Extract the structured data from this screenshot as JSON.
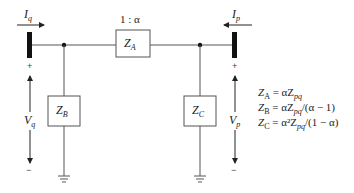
{
  "diagram": {
    "type": "circuit",
    "currents": {
      "left": {
        "symbol": "I",
        "sub": "q"
      },
      "right": {
        "symbol": "I",
        "sub": "p"
      }
    },
    "voltages": {
      "left": {
        "symbol": "V",
        "sub": "q",
        "plus": "+",
        "minus": "−"
      },
      "right": {
        "symbol": "V",
        "sub": "p",
        "plus": "+",
        "minus": "−"
      }
    },
    "ratio_label": "1 : α",
    "impedances": {
      "series": {
        "symbol": "Z",
        "sub": "A"
      },
      "shunt_left": {
        "symbol": "Z",
        "sub": "B"
      },
      "shunt_right": {
        "symbol": "Z",
        "sub": "C"
      }
    },
    "equations": [
      "Z_A = αZ_pq",
      "Z_B = αZ_pq/(α − 1)",
      "Z_C = α²Z_pq/(1 − α)"
    ],
    "equations_display": {
      "eq1": {
        "lhs": "Z",
        "lhs_sub": "A",
        "rhs_pre": " = αZ",
        "rhs_sub": "pq",
        "rhs_post": ""
      },
      "eq2": {
        "lhs": "Z",
        "lhs_sub": "B",
        "rhs_pre": " = αZ",
        "rhs_sub": "pq",
        "rhs_post": "/(α − 1)"
      },
      "eq3": {
        "lhs": "Z",
        "lhs_sub": "C",
        "rhs_pre": " = α²Z",
        "rhs_sub": "pq",
        "rhs_post": "/(1 − α)"
      }
    },
    "colors": {
      "line": "#555555",
      "bus": "#111111",
      "text": "#222222"
    }
  }
}
